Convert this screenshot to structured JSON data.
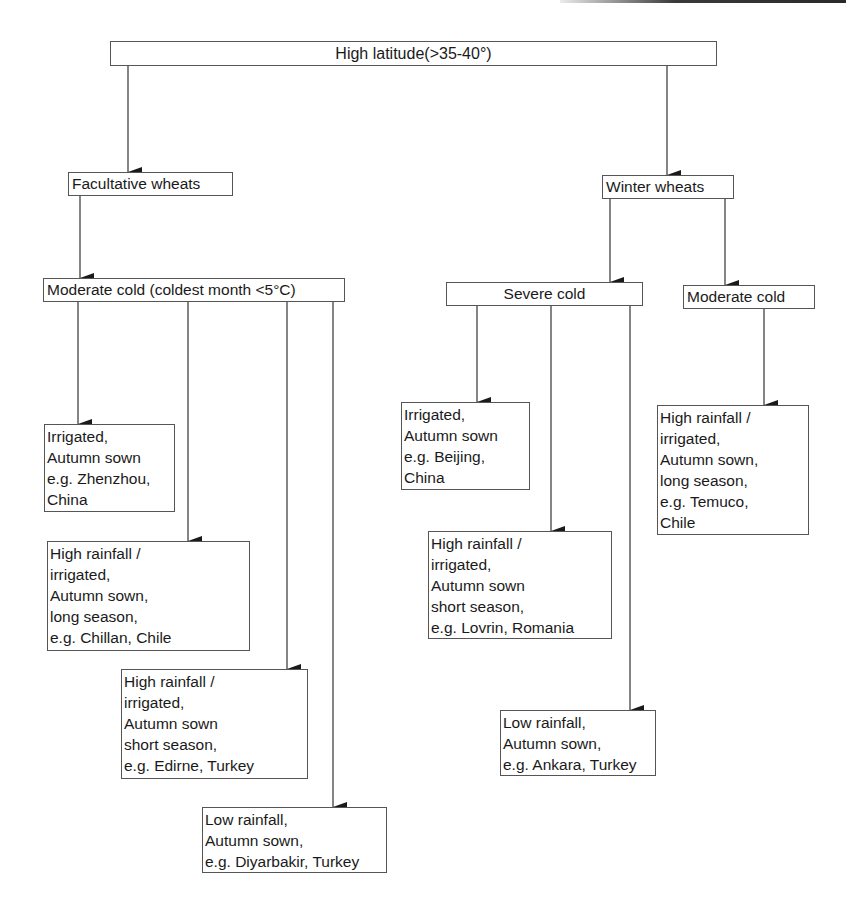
{
  "diagram": {
    "type": "flowchart",
    "root": {
      "id": "root",
      "label": "High latitude(>35-40°)"
    },
    "nodes": [
      {
        "id": "facultative",
        "label": "Facultative wheats"
      },
      {
        "id": "winter",
        "label": "Winter wheats"
      },
      {
        "id": "mod_cold_left",
        "label": "Moderate cold (coldest month <5°C)"
      },
      {
        "id": "severe_cold",
        "label": "Severe cold"
      },
      {
        "id": "mod_cold_right",
        "label": "Moderate cold"
      },
      {
        "id": "zhenzhou",
        "label": "Irrigated,\nAutumn sown\ne.g. Zhenzhou,\nChina"
      },
      {
        "id": "chillan",
        "label": "High rainfall /\nirrigated,\nAutumn sown,\nlong season,\ne.g. Chillan, Chile"
      },
      {
        "id": "edirne",
        "label": "High rainfall /\nirrigated,\nAutumn sown\nshort season,\ne.g. Edirne, Turkey"
      },
      {
        "id": "diyarbakir",
        "label": "Low  rainfall,\nAutumn sown,\ne.g. Diyarbakir, Turkey"
      },
      {
        "id": "beijing",
        "label": "Irrigated,\nAutumn sown\ne.g. Beijing,\nChina"
      },
      {
        "id": "lovrin",
        "label": "High rainfall /\nirrigated,\nAutumn sown\nshort season,\ne.g. Lovrin, Romania"
      },
      {
        "id": "ankara",
        "label": "Low  rainfall,\nAutumn sown,\ne.g. Ankara, Turkey"
      },
      {
        "id": "temuco",
        "label": "High rainfall /\nirrigated,\nAutumn sown,\nlong season,\ne.g. Temuco,\nChile"
      }
    ],
    "edges": [
      {
        "from": "root",
        "to": "facultative"
      },
      {
        "from": "root",
        "to": "winter"
      },
      {
        "from": "facultative",
        "to": "mod_cold_left"
      },
      {
        "from": "winter",
        "to": "severe_cold"
      },
      {
        "from": "winter",
        "to": "mod_cold_right"
      },
      {
        "from": "mod_cold_left",
        "to": "zhenzhou"
      },
      {
        "from": "mod_cold_left",
        "to": "chillan"
      },
      {
        "from": "mod_cold_left",
        "to": "edirne"
      },
      {
        "from": "mod_cold_left",
        "to": "diyarbakir"
      },
      {
        "from": "severe_cold",
        "to": "beijing"
      },
      {
        "from": "severe_cold",
        "to": "lovrin"
      },
      {
        "from": "severe_cold",
        "to": "ankara"
      },
      {
        "from": "mod_cold_right",
        "to": "temuco"
      }
    ]
  }
}
